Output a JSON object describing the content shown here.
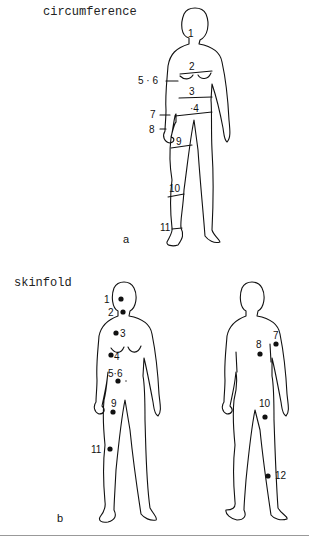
{
  "panel_a": {
    "title": "circumference",
    "letter": "a",
    "labels": [
      "1",
      "2",
      "3",
      "·4",
      "5 · 6",
      "7",
      "8",
      "9",
      "10",
      "11"
    ]
  },
  "panel_b": {
    "title": "skinfold",
    "letter": "b",
    "front_labels": [
      "1",
      "2",
      "3",
      "4",
      "5·6",
      "9",
      "11"
    ],
    "back_labels": [
      "7",
      "8",
      "10",
      "12"
    ]
  }
}
